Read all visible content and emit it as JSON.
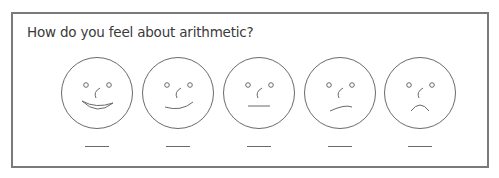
{
  "question": "How do you feel about arithmetic?",
  "options": [
    {
      "id": "very-happy",
      "mouth": "big-smile",
      "answer": ""
    },
    {
      "id": "happy",
      "mouth": "smile",
      "answer": ""
    },
    {
      "id": "neutral",
      "mouth": "flat",
      "answer": ""
    },
    {
      "id": "unhappy",
      "mouth": "skewed",
      "answer": ""
    },
    {
      "id": "sad",
      "mouth": "frown",
      "answer": ""
    }
  ],
  "colors": {
    "border": "#7a7a7a",
    "line": "#6a6a6a",
    "text": "#3a3a3a"
  }
}
